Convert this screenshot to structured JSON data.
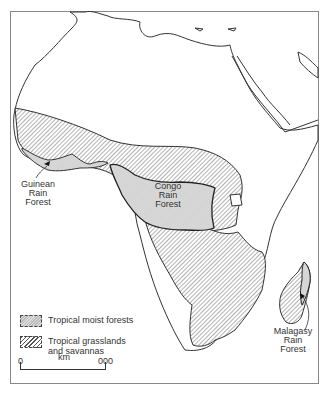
{
  "map": {
    "subject": "Africa",
    "region_labels": [
      {
        "id": "guinean",
        "text": "Guinean\nRain\nForest"
      },
      {
        "id": "congo",
        "text": "Congo\nRain\nForest"
      },
      {
        "id": "malagasy",
        "text": "Malagasy\nRain\nForest"
      }
    ],
    "guinean_label": [
      "Guinean",
      "Rain",
      "Forest"
    ],
    "congo_label": [
      "Congo",
      "Rain",
      "Forest"
    ],
    "malagasy_label": [
      "Malagasy",
      "Rain",
      "Forest"
    ]
  },
  "legend": {
    "items": [
      {
        "label": "Tropical moist forests",
        "pattern": "dotted-grey"
      },
      {
        "label": "Tropical grasslands and savannas",
        "pattern": "hatched",
        "line1": "Tropical grasslands",
        "line2": "and savannas"
      }
    ]
  },
  "scale_bar": {
    "start": "0",
    "unit": "km",
    "end": "000"
  },
  "colors": {
    "outline": "#333333",
    "moist_forest_fill": "#d6d6d6",
    "hatch": "#555555"
  }
}
